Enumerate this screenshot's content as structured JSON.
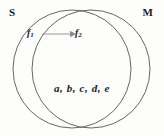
{
  "diagram": {
    "type": "venn-two-set",
    "background_color": "#fdfdfc",
    "outline_color": "#555555",
    "arrow_color": "#8d8d8d",
    "text_color": "#1a1a1a",
    "left_set": {
      "label": "S",
      "center_x": 72,
      "center_y": 69,
      "radius": 59
    },
    "right_set": {
      "label": "M",
      "center_x": 91,
      "center_y": 69,
      "radius": 59
    },
    "mapping": {
      "source_label": "f",
      "source_subscript": "1",
      "target_label": "f",
      "target_subscript": "2",
      "arrow_glyph": "right-arrow",
      "arrow_x_start": 44,
      "arrow_x_end": 72,
      "arrow_y": 34
    },
    "intersection": {
      "elements_text": "a, b, c, d, e",
      "elements": [
        "a",
        "b",
        "c",
        "d",
        "e"
      ]
    }
  }
}
